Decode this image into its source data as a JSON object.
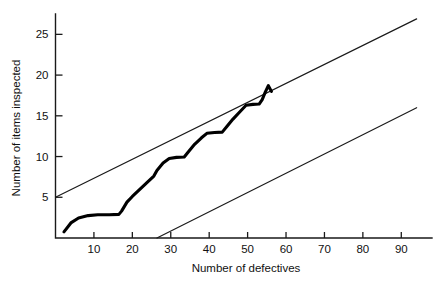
{
  "chart_data": {
    "type": "line",
    "title": "",
    "subtitle": "",
    "xlabel": "Number of defectives",
    "ylabel": "Number of items inspected",
    "xlim": [
      0,
      95
    ],
    "ylim": [
      0,
      27.5
    ],
    "xticks": [
      10,
      20,
      30,
      40,
      50,
      60,
      70,
      80,
      90
    ],
    "yticks": [
      5,
      10,
      15,
      20,
      25
    ],
    "xtick_labels": [
      "10",
      "20",
      "30",
      "40",
      "50",
      "60",
      "70",
      "80",
      "90"
    ],
    "ytick_labels": [
      "5",
      "10",
      "15",
      "20",
      "25"
    ],
    "grid": false,
    "legend": null,
    "annotations": [],
    "series": [
      {
        "name": "Upper decision line",
        "kind": "line",
        "style": "thin-straight",
        "color": "#1a1a1a",
        "points": [
          [
            0,
            5.0
          ],
          [
            94,
            26.9
          ]
        ]
      },
      {
        "name": "Lower decision line",
        "kind": "line",
        "style": "thin-straight",
        "color": "#1a1a1a",
        "points": [
          [
            26.4,
            0.0
          ],
          [
            94,
            16.0
          ]
        ]
      },
      {
        "name": "Cumulative inspection path",
        "kind": "line",
        "style": "thick-stepped",
        "color": "#000000",
        "points": [
          [
            2.2,
            0.75
          ],
          [
            4.0,
            1.85
          ],
          [
            6.0,
            2.45
          ],
          [
            8.5,
            2.75
          ],
          [
            11.0,
            2.85
          ],
          [
            14.0,
            2.85
          ],
          [
            16.5,
            2.9
          ],
          [
            17.2,
            3.3
          ],
          [
            18.6,
            4.4
          ],
          [
            20.0,
            5.1
          ],
          [
            22.0,
            6.0
          ],
          [
            24.0,
            6.9
          ],
          [
            25.6,
            7.6
          ],
          [
            26.4,
            8.3
          ],
          [
            28.0,
            9.2
          ],
          [
            29.6,
            9.75
          ],
          [
            31.5,
            9.9
          ],
          [
            33.5,
            9.95
          ],
          [
            34.6,
            10.6
          ],
          [
            36.2,
            11.5
          ],
          [
            38.0,
            12.3
          ],
          [
            39.4,
            12.85
          ],
          [
            41.4,
            12.95
          ],
          [
            43.4,
            13.0
          ],
          [
            44.6,
            13.7
          ],
          [
            46.2,
            14.6
          ],
          [
            48.0,
            15.5
          ],
          [
            49.6,
            16.3
          ],
          [
            51.4,
            16.4
          ],
          [
            53.0,
            16.45
          ],
          [
            53.8,
            17.0
          ],
          [
            54.6,
            17.9
          ],
          [
            55.4,
            18.7
          ],
          [
            56.2,
            18.0
          ]
        ]
      }
    ]
  },
  "axes": {
    "y_axis_label": "Number of items inspected",
    "x_axis_label": "Number of defectives"
  }
}
